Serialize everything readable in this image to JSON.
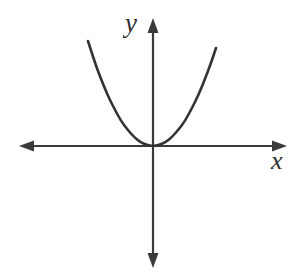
{
  "figure": {
    "width": 306,
    "height": 272,
    "background_color": "#ffffff",
    "line_color": "#3a3a3a",
    "curve_color": "#333333"
  },
  "axes": {
    "x_label": "x",
    "y_label": "y",
    "origin": {
      "x": 153,
      "y": 146
    },
    "x_axis": {
      "orientation": "horizontal",
      "y": 146,
      "left_end": 19,
      "right_end": 287,
      "arrow_left": true,
      "arrow_right": true
    },
    "y_axis": {
      "orientation": "vertical",
      "x": 153,
      "top_end": 18,
      "bottom_end": 268,
      "arrow_up": true,
      "arrow_down": true
    },
    "ticks": [],
    "tick_labels": [],
    "grid": false
  },
  "chart_data": {
    "type": "line",
    "title": "",
    "subtitle": "",
    "xlabel": "x",
    "ylabel": "y",
    "curve_name": "parabola",
    "equation": "y = a*x^2",
    "vertex": {
      "x": 0,
      "y": 0
    },
    "opens": "up",
    "tangent_to_x_axis": true,
    "a_pixels": 0.0248,
    "xlim": [
      -65,
      63
    ],
    "ylim": [
      0,
      105
    ],
    "grid": false,
    "legend": "none",
    "x": [
      -65,
      -58,
      -52,
      -45,
      -39,
      -32,
      -26,
      -19,
      -13,
      -6,
      0,
      6,
      13,
      19,
      26,
      32,
      39,
      45,
      52,
      58,
      63
    ],
    "y": [
      104.8,
      83.4,
      67.1,
      50.2,
      37.7,
      25.4,
      16.8,
      9.0,
      4.2,
      0.9,
      0,
      0.9,
      4.2,
      9.0,
      16.8,
      25.4,
      37.7,
      50.2,
      67.1,
      83.4,
      98.4
    ],
    "points_px": [
      [
        88,
        41
      ],
      [
        95,
        63
      ],
      [
        101,
        79
      ],
      [
        108,
        96
      ],
      [
        114,
        108
      ],
      [
        121,
        121
      ],
      [
        127,
        129
      ],
      [
        134,
        137
      ],
      [
        140,
        142
      ],
      [
        147,
        145
      ],
      [
        153,
        146
      ],
      [
        159,
        145
      ],
      [
        166,
        142
      ],
      [
        172,
        137
      ],
      [
        179,
        129
      ],
      [
        185,
        121
      ],
      [
        192,
        108
      ],
      [
        198,
        96
      ],
      [
        205,
        79
      ],
      [
        211,
        63
      ],
      [
        216,
        48
      ]
    ],
    "annotations": []
  }
}
